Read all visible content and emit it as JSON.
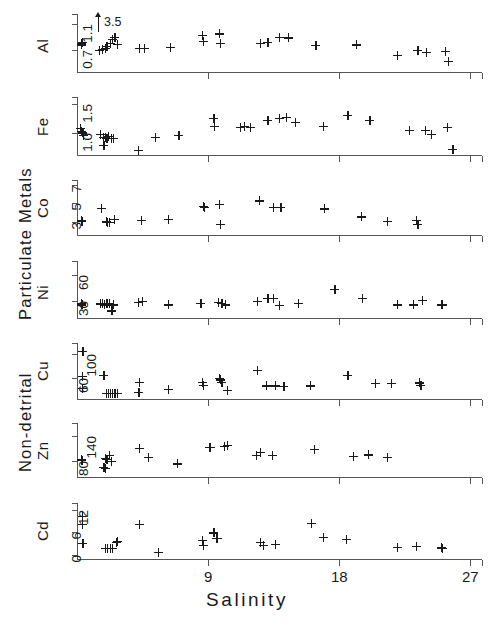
{
  "chart_data": {
    "type": "scatter",
    "title": "",
    "xlabel": "Salinity",
    "xlim": [
      0,
      27.8
    ],
    "xticks": [
      9,
      18,
      27
    ],
    "xticklabels": [
      "9",
      "18",
      "27"
    ],
    "grid": false,
    "legend": null,
    "marker": "+",
    "group_labels": [
      "Particulate Metals",
      "Non-detrital"
    ],
    "annotations": [
      {
        "panel": "Al",
        "text": "3.5",
        "x": 0.95,
        "note": "off-scale point indicated by up arrow"
      }
    ],
    "panels": [
      {
        "name": "Al",
        "ylabel": "Al",
        "yticks": [
          0.7,
          1.1
        ],
        "yticklabels": [
          "0.7",
          "1.1"
        ],
        "ylim": [
          0.36,
          1.26
        ],
        "points": [
          [
            0.3,
            0.8
          ],
          [
            0.3,
            0.78
          ],
          [
            0.35,
            0.82
          ],
          [
            1.55,
            0.7
          ],
          [
            1.75,
            0.71
          ],
          [
            1.95,
            0.73
          ],
          [
            2.05,
            0.76
          ],
          [
            2.3,
            0.8
          ],
          [
            2.45,
            0.86
          ],
          [
            2.6,
            0.9
          ],
          [
            2.75,
            0.79
          ],
          [
            4.3,
            0.72
          ],
          [
            4.6,
            0.72
          ],
          [
            6.4,
            0.74
          ],
          [
            8.6,
            0.93
          ],
          [
            8.65,
            0.84
          ],
          [
            9.8,
            0.95
          ],
          [
            9.85,
            0.8
          ],
          [
            12.6,
            0.8
          ],
          [
            13.1,
            0.82
          ],
          [
            13.9,
            0.9
          ],
          [
            14.5,
            0.89
          ],
          [
            16.4,
            0.77
          ],
          [
            19.2,
            0.78
          ],
          [
            22.0,
            0.62
          ],
          [
            23.4,
            0.7
          ],
          [
            24.0,
            0.66
          ],
          [
            25.3,
            0.68
          ],
          [
            25.5,
            0.53
          ]
        ]
      },
      {
        "name": "Fe",
        "ylabel": "Fe",
        "yticks": [
          1.0,
          1.5
        ],
        "yticklabels": [
          "1.0",
          "1.5"
        ],
        "ylim": [
          0.62,
          1.62
        ],
        "points": [
          [
            0.25,
            1.08
          ],
          [
            0.28,
            1.02
          ],
          [
            0.4,
            1.0
          ],
          [
            0.45,
            0.96
          ],
          [
            1.6,
            0.98
          ],
          [
            1.8,
            0.92
          ],
          [
            1.95,
            0.93
          ],
          [
            2.05,
            0.9
          ],
          [
            2.15,
            0.94
          ],
          [
            2.35,
            0.91
          ],
          [
            2.5,
            0.9
          ],
          [
            1.85,
            0.78
          ],
          [
            4.2,
            0.7
          ],
          [
            5.4,
            0.92
          ],
          [
            7.0,
            0.96
          ],
          [
            9.4,
            1.25
          ],
          [
            9.45,
            1.12
          ],
          [
            11.2,
            1.1
          ],
          [
            11.5,
            1.12
          ],
          [
            11.9,
            1.1
          ],
          [
            13.1,
            1.21
          ],
          [
            13.9,
            1.25
          ],
          [
            14.4,
            1.27
          ],
          [
            15.0,
            1.18
          ],
          [
            16.9,
            1.12
          ],
          [
            18.6,
            1.3
          ],
          [
            20.1,
            1.22
          ],
          [
            22.8,
            1.05
          ],
          [
            23.9,
            1.04
          ],
          [
            24.3,
            0.98
          ],
          [
            25.4,
            1.1
          ],
          [
            25.8,
            0.72
          ]
        ]
      },
      {
        "name": "Co",
        "ylabel": "Co",
        "yticks": [
          3,
          5,
          7
        ],
        "yticklabels": [
          "3",
          "5",
          "7"
        ],
        "ylim": [
          1.6,
          7.5
        ],
        "points": [
          [
            0.3,
            3.15
          ],
          [
            0.34,
            3.1
          ],
          [
            1.7,
            4.45
          ],
          [
            2.0,
            3.0
          ],
          [
            2.1,
            2.95
          ],
          [
            2.25,
            2.98
          ],
          [
            2.55,
            3.25
          ],
          [
            4.4,
            3.2
          ],
          [
            6.3,
            3.3
          ],
          [
            8.7,
            4.7
          ],
          [
            8.75,
            4.55
          ],
          [
            9.8,
            4.85
          ],
          [
            9.85,
            2.7
          ],
          [
            12.5,
            5.25
          ],
          [
            13.5,
            4.55
          ],
          [
            14.0,
            4.6
          ],
          [
            17.0,
            4.4
          ],
          [
            19.5,
            3.55
          ],
          [
            21.3,
            3.1
          ],
          [
            23.3,
            3.2
          ],
          [
            23.4,
            2.7
          ]
        ]
      },
      {
        "name": "Ni",
        "ylabel": "Ni",
        "yticks": [
          30,
          60
        ],
        "yticklabels": [
          "30",
          "60"
        ],
        "ylim": [
          11,
          76
        ],
        "points": [
          [
            0.3,
            27
          ],
          [
            0.34,
            26
          ],
          [
            1.6,
            27
          ],
          [
            1.75,
            27
          ],
          [
            1.9,
            26
          ],
          [
            2.05,
            27
          ],
          [
            2.25,
            27
          ],
          [
            2.5,
            26
          ],
          [
            2.4,
            19
          ],
          [
            4.2,
            29
          ],
          [
            4.5,
            30
          ],
          [
            6.3,
            26
          ],
          [
            8.5,
            28
          ],
          [
            9.7,
            29
          ],
          [
            9.95,
            28
          ],
          [
            10.2,
            26
          ],
          [
            12.4,
            30
          ],
          [
            13.1,
            33
          ],
          [
            13.5,
            33
          ],
          [
            13.9,
            25
          ],
          [
            15.2,
            28
          ],
          [
            17.7,
            44
          ],
          [
            19.6,
            33
          ],
          [
            22.0,
            26
          ],
          [
            23.1,
            26
          ],
          [
            23.7,
            31
          ],
          [
            25.0,
            26
          ],
          [
            25.1,
            26
          ]
        ]
      },
      {
        "name": "Cu",
        "ylabel": "Cu",
        "yticks": [
          60,
          100
        ],
        "yticklabels": [
          "60",
          "100"
        ],
        "ylim": [
          24,
          118
        ],
        "points": [
          [
            0.4,
            104
          ],
          [
            0.35,
            62
          ],
          [
            0.35,
            42
          ],
          [
            1.85,
            63
          ],
          [
            2.0,
            33
          ],
          [
            2.15,
            33
          ],
          [
            2.3,
            33
          ],
          [
            2.45,
            34
          ],
          [
            2.6,
            33
          ],
          [
            2.75,
            34
          ],
          [
            4.3,
            52
          ],
          [
            4.25,
            35
          ],
          [
            6.3,
            40
          ],
          [
            8.6,
            52
          ],
          [
            8.65,
            47
          ],
          [
            9.8,
            58
          ],
          [
            9.85,
            56
          ],
          [
            9.95,
            52
          ],
          [
            10.3,
            38
          ],
          [
            12.4,
            72
          ],
          [
            13.0,
            46
          ],
          [
            13.6,
            46
          ],
          [
            14.2,
            45
          ],
          [
            16.0,
            46
          ],
          [
            18.6,
            64
          ],
          [
            20.5,
            50
          ],
          [
            21.6,
            50
          ],
          [
            23.5,
            51
          ],
          [
            23.6,
            47
          ]
        ]
      },
      {
        "name": "Zn",
        "ylabel": "Zn",
        "yticks": [
          80,
          140
        ],
        "yticklabels": [
          "80",
          "140"
        ],
        "ylim": [
          40,
          172
        ],
        "points": [
          [
            0.3,
            82
          ],
          [
            0.34,
            80
          ],
          [
            1.95,
            86
          ],
          [
            2.05,
            84
          ],
          [
            2.2,
            93
          ],
          [
            2.35,
            78
          ],
          [
            1.85,
            63
          ],
          [
            1.95,
            62
          ],
          [
            4.3,
            110
          ],
          [
            4.9,
            88
          ],
          [
            6.9,
            72
          ],
          [
            9.1,
            113
          ],
          [
            9.15,
            112
          ],
          [
            10.1,
            115
          ],
          [
            10.3,
            118
          ],
          [
            12.3,
            93
          ],
          [
            12.6,
            100
          ],
          [
            13.4,
            92
          ],
          [
            16.3,
            107
          ],
          [
            19.0,
            90
          ],
          [
            20.0,
            94
          ],
          [
            21.3,
            88
          ]
        ]
      },
      {
        "name": "Cd",
        "ylabel": "Cd",
        "yticks": [
          0,
          6,
          12
        ],
        "yticklabels": [
          "0",
          "6",
          "12"
        ],
        "ylim": [
          -1.2,
          14
        ],
        "points": [
          [
            0.35,
            10.3
          ],
          [
            0.35,
            8.1
          ],
          [
            0.4,
            3.0
          ],
          [
            1.95,
            1.6
          ],
          [
            2.1,
            1.6
          ],
          [
            2.3,
            1.7
          ],
          [
            2.45,
            1.6
          ],
          [
            2.7,
            3.3
          ],
          [
            2.8,
            3.5
          ],
          [
            4.3,
            8.3
          ],
          [
            5.6,
            0.5
          ],
          [
            8.6,
            3.9
          ],
          [
            8.65,
            2.6
          ],
          [
            9.4,
            5.9
          ],
          [
            9.6,
            4.4
          ],
          [
            9.65,
            4.3
          ],
          [
            12.6,
            3.3
          ],
          [
            12.8,
            2.5
          ],
          [
            13.6,
            2.8
          ],
          [
            16.1,
            8.5
          ],
          [
            16.9,
            4.6
          ],
          [
            18.5,
            4.2
          ],
          [
            22.0,
            2.0
          ],
          [
            23.3,
            2.3
          ],
          [
            25.0,
            1.8
          ],
          [
            25.1,
            1.7
          ]
        ]
      }
    ]
  }
}
